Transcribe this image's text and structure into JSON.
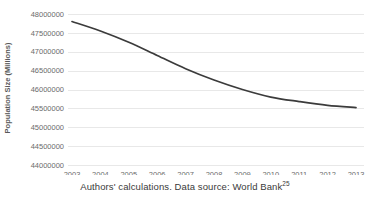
{
  "caption": {
    "text": "Authors' calculations. Data source: World Bank",
    "reference": "25"
  },
  "chart_data": {
    "type": "line",
    "title": "",
    "xlabel": "",
    "ylabel": "Population Size (Millions)",
    "x": [
      2003,
      2004,
      2005,
      2006,
      2007,
      2008,
      2009,
      2010,
      2011,
      2012,
      2013
    ],
    "categories": [
      "2003",
      "2004",
      "2005",
      "2006",
      "2007",
      "2008",
      "2009",
      "2010",
      "2011",
      "2012",
      "2013"
    ],
    "values": [
      47800000,
      47550000,
      47250000,
      46900000,
      46550000,
      46250000,
      46000000,
      45800000,
      45680000,
      45580000,
      45520000
    ],
    "series": [
      {
        "name": "Population Size",
        "values": [
          47800000,
          47550000,
          47250000,
          46900000,
          46550000,
          46250000,
          46000000,
          45800000,
          45680000,
          45580000,
          45520000
        ],
        "color": "#3b3b3b"
      }
    ],
    "ylim": [
      44000000,
      48000000
    ],
    "ytick_values": [
      44000000,
      44500000,
      45000000,
      45500000,
      46000000,
      46500000,
      47000000,
      47500000,
      48000000
    ],
    "ytick_labels": [
      "44000000",
      "44500000",
      "45000000",
      "45500000",
      "46000000",
      "46500000",
      "47000000",
      "47500000",
      "48000000"
    ],
    "xlim": [
      2003,
      2013
    ],
    "grid": "horizontal",
    "legend": "none"
  }
}
